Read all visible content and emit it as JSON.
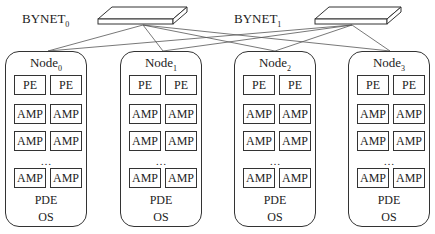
{
  "switches": [
    {
      "name": "BYNET",
      "sub": "0"
    },
    {
      "name": "BYNET",
      "sub": "1"
    }
  ],
  "nodes": [
    {
      "name": "Node",
      "sub": "0",
      "pe": [
        "PE",
        "PE"
      ],
      "amp": [
        "AMP",
        "AMP"
      ],
      "ellipsis": "…",
      "pde": "PDE",
      "os": "OS"
    },
    {
      "name": "Node",
      "sub": "1",
      "pe": [
        "PE",
        "PE"
      ],
      "amp": [
        "AMP",
        "AMP"
      ],
      "ellipsis": "…",
      "pde": "PDE",
      "os": "OS"
    },
    {
      "name": "Node",
      "sub": "2",
      "pe": [
        "PE",
        "PE"
      ],
      "amp": [
        "AMP",
        "AMP"
      ],
      "ellipsis": "…",
      "pde": "PDE",
      "os": "OS"
    },
    {
      "name": "Node",
      "sub": "3",
      "pe": [
        "PE",
        "PE"
      ],
      "amp": [
        "AMP",
        "AMP"
      ],
      "ellipsis": "…",
      "pde": "PDE",
      "os": "OS"
    }
  ]
}
